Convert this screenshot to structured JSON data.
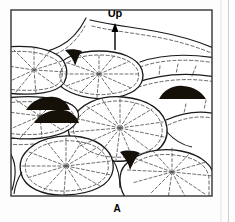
{
  "figure": {
    "panel_label": "A",
    "direction_label": "Up",
    "frame": {
      "x": 11,
      "y": 10,
      "width": 201,
      "height": 186,
      "stroke_color": "#333333",
      "stroke_width": 1.4,
      "fill_color": "#ffffff"
    },
    "colors": {
      "outline": "#1a1a1a",
      "dashed": "#555555",
      "fill_dark": "#151008",
      "background": "#ffffff",
      "text": "#000000",
      "page": "#fdfdfd"
    },
    "direction_arrow": {
      "x": 115,
      "y_tail": 50,
      "y_head": 23,
      "head_width": 7,
      "head_height": 9
    },
    "labels": {
      "up": {
        "x": 115,
        "y": 17,
        "font_size": 11,
        "weight": "bold"
      },
      "panel": {
        "x": 117,
        "y": 212,
        "font_size": 10,
        "weight": "bold"
      }
    },
    "pillows": [
      {
        "name": "pillow-top-left-ridge",
        "outline": "M 11 60 C 28 54 48 50 62 44 C 74 39 82 30 88 20",
        "has_radial": false,
        "radial_center": null
      },
      {
        "name": "pillow-top-right-ridge",
        "outline": "M 90 22 C 108 26 128 28 150 31 C 172 34 194 40 212 47",
        "has_radial": false,
        "radial_center": null
      },
      {
        "name": "pillow-upper-left",
        "outline": "M 11 47 C 30 45 46 48 58 56 C 66 62 68 72 64 82 C 57 92 36 95 11 92",
        "has_radial": true,
        "radial_center": {
          "x": 34,
          "y": 70
        }
      },
      {
        "name": "pillow-upper-center",
        "outline": "M 56 68 C 62 58 78 52 98 52 C 120 52 136 58 141 70 C 145 82 138 92 120 96 C 100 100 80 97 68 90 C 58 84 53 76 56 68 Z",
        "has_radial": true,
        "radial_center": {
          "x": 99,
          "y": 74
        }
      },
      {
        "name": "pillow-upper-right",
        "outline": "M 143 64 C 160 58 182 56 212 60",
        "has_radial": false,
        "radial_center": null
      },
      {
        "name": "pillow-right-upper",
        "outline": "M 136 82 C 158 74 186 72 212 76",
        "has_radial": false,
        "radial_center": null
      },
      {
        "name": "pillow-mid-left",
        "outline": "M 11 98 C 34 95 58 96 72 104 C 80 110 80 120 70 128 C 55 138 30 140 11 136",
        "has_radial": true,
        "radial_center": {
          "x": 40,
          "y": 116
        }
      },
      {
        "name": "pillow-center-large",
        "outline": "M 70 120 C 78 104 98 96 122 98 C 148 100 164 112 166 128 C 167 146 150 158 124 160 C 98 162 78 152 71 138 C 67 131 67 126 70 120 Z",
        "has_radial": true,
        "radial_center": {
          "x": 120,
          "y": 128
        }
      },
      {
        "name": "pillow-right-mid",
        "outline": "M 166 116 C 184 110 198 110 212 114",
        "has_radial": false,
        "radial_center": null
      },
      {
        "name": "pillow-bottom-left",
        "outline": "M 24 152 C 34 140 56 134 80 138 C 102 142 114 154 112 170 C 110 184 92 193 66 194 C 42 195 24 186 21 172 C 19 164 20 157 24 152 Z",
        "has_radial": true,
        "radial_center": {
          "x": 66,
          "y": 166
        }
      },
      {
        "name": "pillow-bottom-right",
        "outline": "M 124 164 C 136 152 158 148 180 152 C 200 156 212 166 212 178 L 212 196 L 126 196 C 118 186 118 172 124 164 Z",
        "has_radial": true,
        "radial_center": {
          "x": 172,
          "y": 172
        }
      },
      {
        "name": "pillow-far-left-bottom",
        "outline": "M 11 150 C 16 158 17 172 12 186",
        "has_radial": false,
        "radial_center": null
      }
    ],
    "dark_lenses": [
      {
        "name": "dark-lens-left-upper",
        "cx": 48,
        "cy": 105,
        "rx": 22,
        "ry": 6
      },
      {
        "name": "dark-lens-left-lower",
        "cx": 56,
        "cy": 118,
        "rx": 22,
        "ry": 6
      },
      {
        "name": "dark-lens-right",
        "cx": 182,
        "cy": 93,
        "rx": 23,
        "ry": 6
      }
    ],
    "wedge_markers": [
      {
        "name": "wedge-upper-left",
        "x": 73,
        "y": 58
      },
      {
        "name": "wedge-lower-center",
        "x": 128,
        "y": 160
      }
    ],
    "caption_note": "Radiating dashed lines represent cooling joints; dark lenses are interstitial fill; wedges mark pillow cusps pointing down."
  },
  "chart_data": {
    "type": "diagram",
    "title": "A",
    "annotations": [
      "Up",
      "A"
    ]
  }
}
